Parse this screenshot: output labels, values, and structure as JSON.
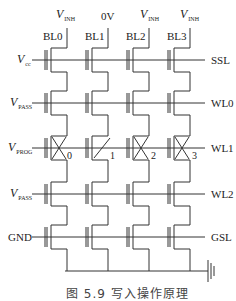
{
  "diagram": {
    "bitlines": [
      {
        "name": "BL0",
        "voltage_main": "V",
        "voltage_sub": "INH"
      },
      {
        "name": "BL1",
        "voltage_main": "0V",
        "voltage_sub": ""
      },
      {
        "name": "BL2",
        "voltage_main": "V",
        "voltage_sub": "INH"
      },
      {
        "name": "BL3",
        "voltage_main": "V",
        "voltage_sub": "INH"
      }
    ],
    "rows": [
      {
        "line": "SSL",
        "bias_main": "V",
        "bias_sub": "cc"
      },
      {
        "line": "WL0",
        "bias_main": "V",
        "bias_sub": "PASS"
      },
      {
        "line": "WL1",
        "bias_main": "V",
        "bias_sub": "PROG"
      },
      {
        "line": "WL2",
        "bias_main": "V",
        "bias_sub": "PASS"
      },
      {
        "line": "GSL",
        "bias_main": "GND",
        "bias_sub": ""
      }
    ],
    "cell_numbers": [
      "0",
      "1",
      "2",
      "3"
    ],
    "caption": "图 5.9  写入操作原理"
  }
}
